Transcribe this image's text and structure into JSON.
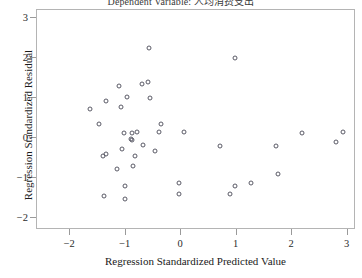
{
  "chart_data": {
    "type": "scatter",
    "title": "Dependent Variable: 人均消费支出",
    "xlabel": "Regression Standardized Predicted Value",
    "ylabel": "Regression Standardized Residual",
    "xlim": [
      -2.6,
      3.15
    ],
    "ylim": [
      -2.3,
      3.2
    ],
    "xticks": [
      -2,
      -1,
      0,
      1,
      2,
      3
    ],
    "yticks": [
      -2,
      -1,
      0,
      1,
      2,
      3
    ],
    "xtick_labels": [
      "−2",
      "−1",
      "0",
      "1",
      "2",
      "3"
    ],
    "ytick_labels": [
      "−2",
      "−1",
      "0",
      "1",
      "2",
      "3"
    ],
    "grid": false,
    "legend": false,
    "marker": "open-circle",
    "marker_color": "#5a5a66",
    "frame_color": "#b4b4b4",
    "n_points": 41,
    "points": [
      {
        "x": -0.58,
        "y": 2.26
      },
      {
        "x": 0.97,
        "y": 2.01
      },
      {
        "x": -1.64,
        "y": 0.73
      },
      {
        "x": -1.35,
        "y": 0.92
      },
      {
        "x": -1.08,
        "y": 0.78
      },
      {
        "x": -0.97,
        "y": 1.02
      },
      {
        "x": -0.56,
        "y": 0.99
      },
      {
        "x": -1.49,
        "y": 0.36
      },
      {
        "x": -0.37,
        "y": 0.36
      },
      {
        "x": -1.04,
        "y": 0.12
      },
      {
        "x": -0.89,
        "y": 0.12
      },
      {
        "x": -0.79,
        "y": 0.15
      },
      {
        "x": -0.91,
        "y": -0.02
      },
      {
        "x": -0.89,
        "y": -0.05
      },
      {
        "x": -1.06,
        "y": -0.27
      },
      {
        "x": -1.41,
        "y": -0.44
      },
      {
        "x": -1.35,
        "y": -0.41
      },
      {
        "x": -0.83,
        "y": -0.44
      },
      {
        "x": -0.87,
        "y": -0.7
      },
      {
        "x": -1.16,
        "y": -0.78
      },
      {
        "x": -0.48,
        "y": -0.33
      },
      {
        "x": -0.41,
        "y": 0.15
      },
      {
        "x": 0.05,
        "y": 0.15
      },
      {
        "x": -0.69,
        "y": -0.17
      },
      {
        "x": 2.17,
        "y": 0.12
      },
      {
        "x": 2.79,
        "y": -0.1
      },
      {
        "x": 2.92,
        "y": 0.15
      },
      {
        "x": 0.7,
        "y": -0.19
      },
      {
        "x": 1.7,
        "y": -0.19
      },
      {
        "x": -1.39,
        "y": -1.46
      },
      {
        "x": -1.02,
        "y": -1.19
      },
      {
        "x": -1.02,
        "y": -1.53
      },
      {
        "x": -0.04,
        "y": -1.12
      },
      {
        "x": 1.74,
        "y": -0.9
      },
      {
        "x": -0.04,
        "y": -1.41
      },
      {
        "x": 0.97,
        "y": -1.19
      },
      {
        "x": 1.25,
        "y": -1.12
      },
      {
        "x": -1.12,
        "y": 1.31
      },
      {
        "x": -0.7,
        "y": 1.35
      },
      {
        "x": -0.6,
        "y": 1.41
      },
      {
        "x": 0.87,
        "y": -1.41
      }
    ]
  }
}
